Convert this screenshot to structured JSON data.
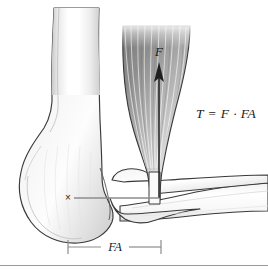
{
  "figure": {
    "labels": {
      "formula": "T = F · FA",
      "force": "F",
      "moment_arm": "FA",
      "pivot_marker": "×"
    },
    "colors": {
      "outline": "#3a3a3a",
      "bone_light": "#fbfbfb",
      "bone_shade": "#d9d9d9",
      "muscle_dark": "#6e6e6e",
      "muscle_light": "#f2f2f2",
      "leader_line": "#8c8c8c",
      "dimension_line": "#8c8c8c",
      "rule": "#9a9a9a",
      "text": "#1a1a1a",
      "background": "#ffffff"
    },
    "parts": [
      {
        "name": "humerus",
        "description": "upper arm bone shown vertically at left with distal condyle"
      },
      {
        "name": "ulna",
        "description": "forearm bone extending horizontally to the right"
      },
      {
        "name": "radius",
        "description": "forearm bone beneath the muscle insertion"
      },
      {
        "name": "biceps-muscle",
        "description": "shaded muscle belly with fiber striations above the elbow"
      },
      {
        "name": "force-arrow",
        "description": "vertical arrow pointing up labelled F"
      },
      {
        "name": "moment-arm-line",
        "description": "horizontal leader from pivot to the line of force action"
      },
      {
        "name": "dimension-line",
        "description": "bracketed span beneath the figure labelled FA"
      },
      {
        "name": "pivot-marker",
        "description": "x marking the elbow joint centre of rotation"
      },
      {
        "name": "baseline-rule",
        "description": "horizontal rule across the lower part of the figure"
      }
    ]
  }
}
